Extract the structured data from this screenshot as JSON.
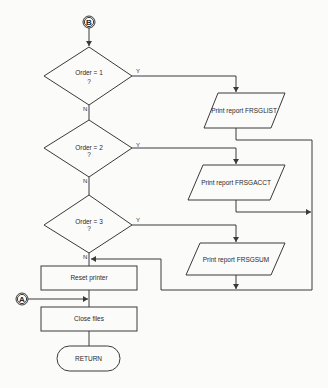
{
  "connectors": {
    "top": "B",
    "side": "A"
  },
  "decisions": [
    {
      "line1": "Order = 1",
      "line2": "?",
      "yes": "Y",
      "no": "N"
    },
    {
      "line1": "Order = 2",
      "line2": "?",
      "yes": "Y",
      "no": "N"
    },
    {
      "line1": "Order = 3",
      "line2": "?",
      "yes": "Y",
      "no": "N"
    }
  ],
  "outputs": [
    {
      "label": "Print report FRSGLIST"
    },
    {
      "label": "Print report FRSGACCT"
    },
    {
      "label": "Print report FRSGSUM"
    }
  ],
  "processes": [
    {
      "label": "Reset printer"
    },
    {
      "label": "Close files"
    }
  ],
  "terminator": {
    "label": "RETURN"
  }
}
